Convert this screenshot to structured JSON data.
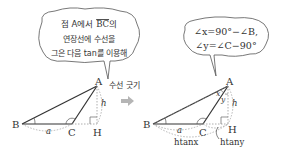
{
  "left_figure": {
    "bubble_lines": [
      "점 A에서 BC의",
      "연장선에 수선을",
      "그은 다음 tan를 이용해"
    ],
    "bubble_line1_parts": {
      "prefix": "점 A에서 ",
      "overlined": "BC",
      "suffix": "의"
    },
    "points": {
      "A": "A",
      "B": "B",
      "C": "C",
      "H": "H"
    },
    "side_a": "a",
    "height_h": "h",
    "annotation": "수선 긋기"
  },
  "arrow": {
    "icon": "right-arrow-icon",
    "color": "#b5b5b5"
  },
  "right_figure": {
    "bubble_lines": [
      "∠x=90°−∠B,",
      "∠y=∠C−90°"
    ],
    "points": {
      "A": "A",
      "B": "B",
      "C": "C",
      "H": "H"
    },
    "angle_x": "x",
    "angle_y": "y",
    "side_a": "a",
    "height_h": "h",
    "label_htanx": "htanx",
    "label_htany": "htany"
  },
  "colors": {
    "line": "#333333",
    "dashed": "#999999",
    "text": "#333333"
  }
}
